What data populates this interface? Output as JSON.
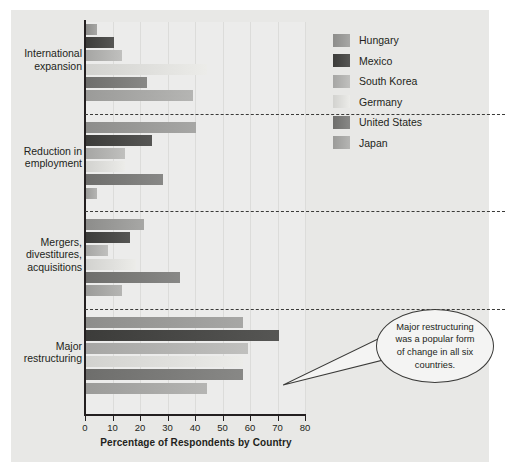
{
  "chart_data": {
    "type": "bar",
    "orientation": "horizontal",
    "title": "",
    "xlabel": "Percentage of Respondents by Country",
    "ylabel": "",
    "xlim": [
      0,
      80
    ],
    "xticks": [
      0,
      10,
      20,
      30,
      40,
      50,
      60,
      70,
      80
    ],
    "grid": true,
    "legend_position": "top-right",
    "categories": [
      "International expansion",
      "Reduction in employment",
      "Mergers, divestitures, acquisitions",
      "Major restructuring"
    ],
    "series": [
      {
        "name": "Hungary",
        "color": "#8d8d8b",
        "values": [
          4,
          40,
          21,
          57
        ]
      },
      {
        "name": "Mexico",
        "color": "#3c3c3a",
        "values": [
          10,
          24,
          16,
          70
        ]
      },
      {
        "name": "South Korea",
        "color": "#a6a6a4",
        "values": [
          13,
          14,
          8,
          59
        ]
      },
      {
        "name": "Germany",
        "color": "#d2d2cf",
        "values": [
          44,
          14,
          18,
          57
        ]
      },
      {
        "name": "United States",
        "color": "#6e6e6c",
        "values": [
          22,
          28,
          34,
          57
        ]
      },
      {
        "name": "Japan",
        "color": "#9b9b99",
        "values": [
          39,
          4,
          13,
          44
        ]
      }
    ],
    "annotations": [
      {
        "text": "Major restructuring was a popular form of change in all six countries.",
        "lines": [
          "Major restructuring",
          "was a popular form",
          "of change in all six",
          "countries."
        ],
        "target_category": "Major restructuring",
        "target_series": "Mexico"
      }
    ]
  },
  "legend": {
    "items": [
      {
        "label": "Hungary"
      },
      {
        "label": "Mexico"
      },
      {
        "label": "South Korea"
      },
      {
        "label": "Germany"
      },
      {
        "label": "United States"
      },
      {
        "label": "Japan"
      }
    ]
  },
  "axis": {
    "x_title": "Percentage of Respondents by Country",
    "tick_labels": [
      "0",
      "10",
      "20",
      "30",
      "40",
      "50",
      "60",
      "70",
      "80"
    ]
  },
  "category_labels": [
    {
      "lines": [
        "International",
        "expansion"
      ]
    },
    {
      "lines": [
        "Reduction in",
        "employment"
      ]
    },
    {
      "lines": [
        "Mergers,",
        "divestitures,",
        "acquisitions"
      ]
    },
    {
      "lines": [
        "Major",
        "restructuring"
      ]
    }
  ],
  "callout": {
    "lines": [
      "Major restructuring",
      "was a popular form",
      "of change in all six",
      "countries."
    ]
  }
}
